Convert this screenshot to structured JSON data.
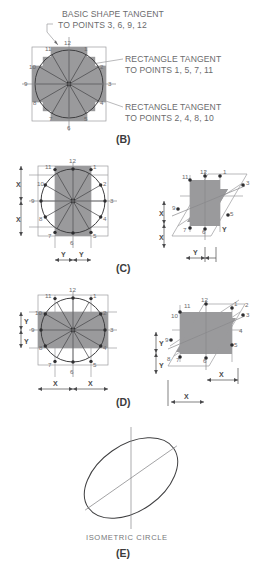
{
  "figure": {
    "title_caption": "ISOMETRIC CIRCLE",
    "background": "#ffffff",
    "shade_color": "#9a9a9c",
    "line_color": "#3f3f41"
  },
  "annotations": [
    {
      "id": "basic-shape-tangent",
      "line1": "BASIC SHAPE TANGENT",
      "line2": "TO POINTS 3, 6, 9, 12"
    },
    {
      "id": "rectangle-tangent-odd",
      "line1": "RECTANGLE TANGENT",
      "line2": "TO POINTS 1, 5, 7, 11"
    },
    {
      "id": "rectangle-tangent-even",
      "line1": "RECTANGLE TANGENT",
      "line2": "TO POINTS 2, 4, 8, 10"
    }
  ],
  "panels": [
    {
      "id": "b",
      "label": "(B)"
    },
    {
      "id": "c",
      "label": "(C)"
    },
    {
      "id": "d",
      "label": "(D)"
    },
    {
      "id": "e",
      "label": "(E)"
    }
  ],
  "point_numbers": [
    "1",
    "2",
    "3",
    "4",
    "5",
    "6",
    "7",
    "8",
    "9",
    "10",
    "11",
    "12"
  ],
  "dimensions": {
    "x": "X",
    "y": "Y"
  },
  "panel_b": {
    "points": [
      "1",
      "2",
      "3",
      "4",
      "5",
      "6",
      "7",
      "8",
      "9",
      "10",
      "11",
      "12"
    ],
    "description": "Twelve point circle with tangent square and inscribed rectangles"
  },
  "panel_c": {
    "vertical_dims": [
      "X",
      "X"
    ],
    "horizontal_dims": [
      "Y",
      "Y"
    ],
    "points": [
      "1",
      "2",
      "3",
      "4",
      "5",
      "6",
      "7",
      "8",
      "9",
      "10",
      "11",
      "12"
    ],
    "iso_vertical_dims": [
      "X",
      "X"
    ],
    "iso_horizontal_dims": [
      "Y",
      "Y"
    ]
  },
  "panel_d": {
    "vertical_dims": [
      "Y",
      "Y"
    ],
    "horizontal_dims": [
      "X",
      "X"
    ],
    "points": [
      "1",
      "2",
      "3",
      "4",
      "5",
      "6",
      "7",
      "8",
      "9",
      "10",
      "11",
      "12"
    ],
    "iso_vertical_dims": [
      "Y",
      "Y"
    ],
    "iso_horizontal_dims": [
      "X",
      "X"
    ]
  },
  "panel_e": {
    "caption": "ISOMETRIC CIRCLE"
  }
}
